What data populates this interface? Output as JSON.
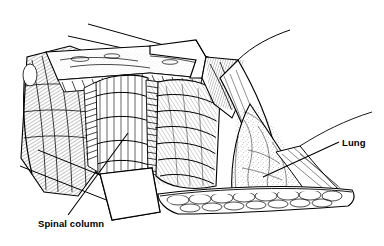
{
  "illustration": {
    "title": "Posterolateral thoracotomy exposure",
    "style": "black-and-white line art, pen-and-ink hatching",
    "background_color": "#ffffff",
    "line_color": "#000000"
  },
  "labels": [
    {
      "id": "spinal-column",
      "text": "Spinal column",
      "x": 38,
      "y": 219
    },
    {
      "id": "lung",
      "text": "Lung",
      "x": 342,
      "y": 138
    }
  ],
  "annotations": {
    "spinal_column_label": "Spinal column",
    "lung_label": "Lung"
  },
  "leader_lines": [
    {
      "for": "spinal-column",
      "from_x": 68,
      "from_y": 215,
      "to_x": 128,
      "to_y": 133
    },
    {
      "for": "lung",
      "from_x": 339,
      "from_y": 142,
      "to_x": 263,
      "to_y": 177
    }
  ],
  "structures": [
    {
      "name": "upper-retractor-blade",
      "description": "white retractor blade across upper incision"
    },
    {
      "name": "lower-retractor-blade",
      "description": "white retractor blade at lower left of wound"
    },
    {
      "name": "right-retractor-blade",
      "description": "white curved retractor blade at right"
    },
    {
      "name": "chest-wall-flap",
      "description": "hatched muscle and fascia layers at left"
    },
    {
      "name": "paraspinal-muscle",
      "description": "vertically striated muscle over spinal column"
    },
    {
      "name": "rib-cage",
      "description": "fanned ribs and intercostal muscle"
    },
    {
      "name": "lung-surface",
      "description": "stippled lung parenchyma in triangular window"
    },
    {
      "name": "fatty-tissue-edge",
      "description": "lobulated cobblestone tissue along lower margin"
    }
  ]
}
